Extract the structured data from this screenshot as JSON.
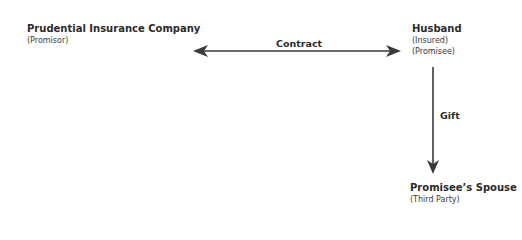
{
  "diagram": {
    "nodes": [
      {
        "id": "promisor",
        "title": "Prudential Insurance Company",
        "roles": [
          "(Promisor)"
        ]
      },
      {
        "id": "promisee",
        "title": "Husband",
        "roles": [
          "(Insured)",
          "(Promisee)"
        ]
      },
      {
        "id": "third_party",
        "title": "Promisee’s Spouse",
        "roles": [
          "(Third Party)"
        ]
      }
    ],
    "edges": [
      {
        "from": "promisor",
        "to": "promisee",
        "label": "Contract",
        "direction": "both"
      },
      {
        "from": "promisee",
        "to": "third_party",
        "label": "Gift",
        "direction": "forward"
      }
    ],
    "colors": {
      "line": "#3a3a3a",
      "text": "#2b2b2b",
      "background": "#ffffff"
    }
  }
}
